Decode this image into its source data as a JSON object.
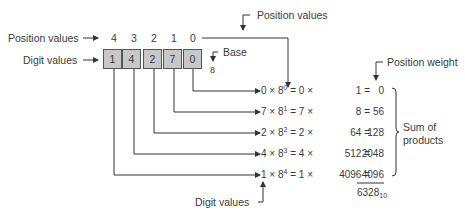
{
  "labels": {
    "position_values_left": "Position values",
    "digit_values_left": "Digit values",
    "position_values_top": "Position values",
    "base": "Base",
    "base_value": "8",
    "position_weight": "Position weight",
    "sum_of_products_line1": "Sum of",
    "sum_of_products_line2": "products",
    "digit_values_bottom": "Digit values"
  },
  "positions": [
    "4",
    "3",
    "2",
    "1",
    "0"
  ],
  "digits": [
    "1",
    "4",
    "2",
    "7",
    "0"
  ],
  "rows": [
    {
      "digit": "0",
      "exp": "0",
      "digit2": "0",
      "weight": "1",
      "product": "0"
    },
    {
      "digit": "7",
      "exp": "1",
      "digit2": "7",
      "weight": "8",
      "product": "56"
    },
    {
      "digit": "2",
      "exp": "2",
      "digit2": "2",
      "weight": "64",
      "product": "128"
    },
    {
      "digit": "4",
      "exp": "3",
      "digit2": "4",
      "weight": "512",
      "product": "2048"
    },
    {
      "digit": "1",
      "exp": "4",
      "digit2": "1",
      "weight": "4096",
      "product": "4096"
    }
  ],
  "result": {
    "value": "6328",
    "base": "10"
  },
  "symbols": {
    "times": "×",
    "base_number": "8",
    "equals": "="
  }
}
